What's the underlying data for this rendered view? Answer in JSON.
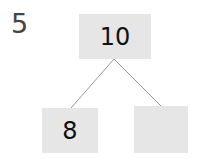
{
  "question_number": "5",
  "number_bond": {
    "whole": "10",
    "parts": [
      "8",
      ""
    ]
  },
  "colors": {
    "box_fill": "#e6e6e6",
    "line": "#999999",
    "text": "#111111"
  }
}
